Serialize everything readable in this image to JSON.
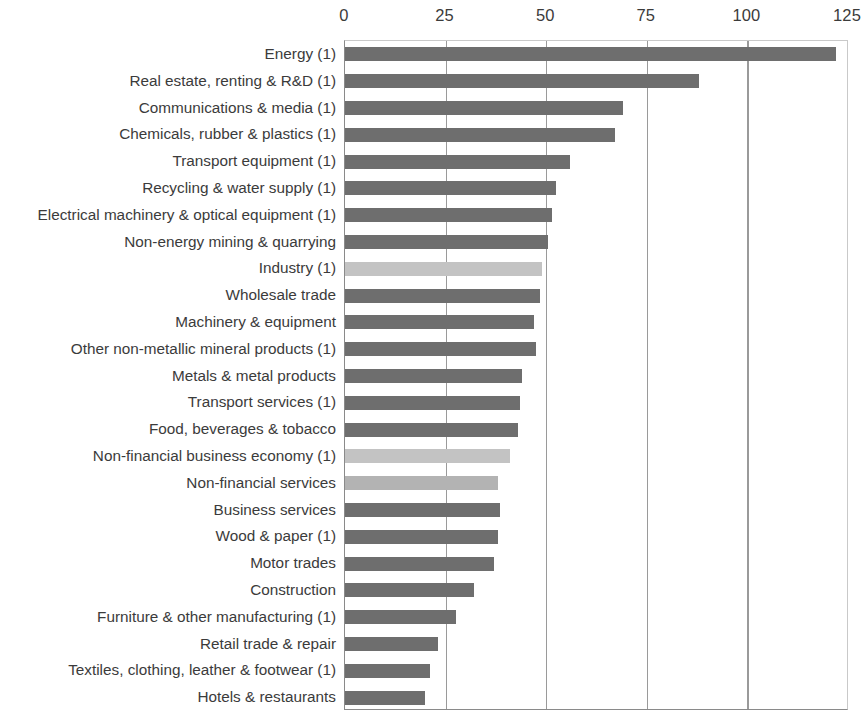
{
  "chart_data": {
    "type": "bar",
    "orientation": "horizontal",
    "title": "",
    "subtitle": "",
    "xlabel": "",
    "ylabel": "",
    "xlim": [
      0,
      125
    ],
    "ylim": null,
    "grid": true,
    "gridlines_at": [
      0,
      25,
      50,
      75,
      100,
      125
    ],
    "legend": null,
    "xticks": [
      "0",
      "25",
      "50",
      "75",
      "100",
      "125"
    ],
    "xtick_values": [
      0,
      25,
      50,
      75,
      100,
      125
    ],
    "categories": [
      "Energy (1)",
      "Real estate, renting & R&D (1)",
      "Communications & media (1)",
      "Chemicals, rubber & plastics (1)",
      "Transport equipment (1)",
      "Recycling & water supply (1)",
      "Electrical machinery & optical equipment (1)",
      "Non-energy mining & quarrying",
      "Industry (1)",
      "Wholesale trade",
      "Machinery & equipment",
      "Other non-metallic mineral products (1)",
      "Metals & metal products",
      "Transport services (1)",
      "Food, beverages & tobacco",
      "Non-financial business economy (1)",
      "Non-financial services",
      "Business services",
      "Wood & paper (1)",
      "Motor trades",
      "Construction",
      "Furniture & other manufacturing (1)",
      "Retail trade & repair",
      "Textiles, clothing, leather & footwear (1)",
      "Hotels & restaurants"
    ],
    "values": [
      122,
      88,
      69,
      67,
      56,
      52.5,
      51.5,
      50.5,
      49,
      48.5,
      47,
      47.5,
      44,
      43.5,
      43,
      41,
      38,
      38.5,
      38,
      37,
      32,
      27.5,
      23,
      21,
      20
    ],
    "bar_styles": [
      "dark",
      "dark",
      "dark",
      "dark",
      "dark",
      "dark",
      "dark",
      "dark",
      "light",
      "dark",
      "dark",
      "dark",
      "dark",
      "dark",
      "dark",
      "light",
      "mid",
      "dark",
      "dark",
      "dark",
      "dark",
      "dark",
      "dark",
      "dark",
      "dark"
    ],
    "colors": {
      "bar_dark": "#6e6e6e",
      "bar_light": "#c3c3c3",
      "bar_mid": "#b3b3b3",
      "gridline": "#9a9a9a",
      "axis": "#8a8a8a",
      "text": "#3b3b3b",
      "background": "#ffffff"
    }
  }
}
